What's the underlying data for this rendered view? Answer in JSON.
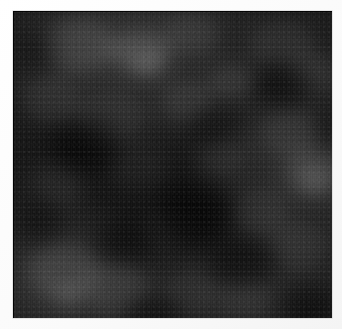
{
  "page": {
    "width": 342,
    "height": 329,
    "background_color": "#fdfdfd"
  },
  "panel": {
    "name": "dark mottled texture",
    "left": 13,
    "top": 11,
    "width": 319,
    "height": 307,
    "base_color": "#1b1b1b",
    "darkest_color": "#0d0d0d",
    "brightest_color": "#3a3a3a",
    "border_color": "#000000",
    "texture_kind": "cloudy-mottled-grain",
    "artifacts": "jpeg 8x8 block edges and fine vertical streaking",
    "has_text": false,
    "has_axes": false,
    "has_legend": false
  },
  "clouds": [
    {
      "x": 30,
      "y": 8,
      "w": 74,
      "h": 54,
      "color": "#3a3a3a",
      "alpha": 0.5,
      "tone": "light"
    },
    {
      "x": 96,
      "y": 18,
      "w": 62,
      "h": 44,
      "color": "#3d3d3d",
      "alpha": 0.55,
      "tone": "light"
    },
    {
      "x": 150,
      "y": 4,
      "w": 56,
      "h": 40,
      "color": "#333333",
      "alpha": 0.4,
      "tone": "light"
    },
    {
      "x": 236,
      "y": 10,
      "w": 66,
      "h": 46,
      "color": "#303030",
      "alpha": 0.38,
      "tone": "light"
    },
    {
      "x": 276,
      "y": 44,
      "w": 48,
      "h": 38,
      "color": "#363636",
      "alpha": 0.42,
      "tone": "light"
    },
    {
      "x": 10,
      "y": 66,
      "w": 58,
      "h": 48,
      "color": "#313131",
      "alpha": 0.36,
      "tone": "light"
    },
    {
      "x": 62,
      "y": 80,
      "w": 70,
      "h": 52,
      "color": "#2e2e2e",
      "alpha": 0.34,
      "tone": "light"
    },
    {
      "x": 148,
      "y": 70,
      "w": 54,
      "h": 40,
      "color": "#343434",
      "alpha": 0.38,
      "tone": "light"
    },
    {
      "x": 196,
      "y": 54,
      "w": 46,
      "h": 34,
      "color": "#383838",
      "alpha": 0.4,
      "tone": "light"
    },
    {
      "x": 246,
      "y": 96,
      "w": 62,
      "h": 52,
      "color": "#313131",
      "alpha": 0.36,
      "tone": "light"
    },
    {
      "x": 272,
      "y": 138,
      "w": 56,
      "h": 48,
      "color": "#373737",
      "alpha": 0.44,
      "tone": "light"
    },
    {
      "x": 184,
      "y": 128,
      "w": 50,
      "h": 40,
      "color": "#2d2d2d",
      "alpha": 0.3,
      "tone": "light"
    },
    {
      "x": 96,
      "y": 134,
      "w": 58,
      "h": 44,
      "color": "#2c2c2c",
      "alpha": 0.28,
      "tone": "light"
    },
    {
      "x": 18,
      "y": 150,
      "w": 54,
      "h": 46,
      "color": "#2f2f2f",
      "alpha": 0.32,
      "tone": "light"
    },
    {
      "x": 216,
      "y": 178,
      "w": 60,
      "h": 46,
      "color": "#2e2e2e",
      "alpha": 0.3,
      "tone": "light"
    },
    {
      "x": 132,
      "y": 196,
      "w": 48,
      "h": 38,
      "color": "#2a2a2a",
      "alpha": 0.26,
      "tone": "light"
    },
    {
      "x": 258,
      "y": 212,
      "w": 58,
      "h": 48,
      "color": "#303030",
      "alpha": 0.32,
      "tone": "light"
    },
    {
      "x": 14,
      "y": 232,
      "w": 72,
      "h": 56,
      "color": "#3a3a3a",
      "alpha": 0.48,
      "tone": "light"
    },
    {
      "x": 70,
      "y": 252,
      "w": 66,
      "h": 50,
      "color": "#363636",
      "alpha": 0.44,
      "tone": "light"
    },
    {
      "x": 150,
      "y": 258,
      "w": 56,
      "h": 44,
      "color": "#2c2c2c",
      "alpha": 0.3,
      "tone": "light"
    },
    {
      "x": 206,
      "y": 264,
      "w": 52,
      "h": 40,
      "color": "#303030",
      "alpha": 0.32,
      "tone": "light"
    },
    {
      "x": 118,
      "y": 40,
      "w": 34,
      "h": 26,
      "color": "#454545",
      "alpha": 0.45,
      "tone": "light"
    },
    {
      "x": 286,
      "y": 156,
      "w": 32,
      "h": 26,
      "color": "#424242",
      "alpha": 0.42,
      "tone": "light"
    },
    {
      "x": 40,
      "y": 272,
      "w": 34,
      "h": 26,
      "color": "#424242",
      "alpha": 0.4,
      "tone": "light"
    },
    {
      "x": 146,
      "y": 176,
      "w": 76,
      "h": 60,
      "color": "#050505",
      "alpha": 0.62,
      "tone": "dark"
    },
    {
      "x": 40,
      "y": 110,
      "w": 64,
      "h": 52,
      "color": "#070707",
      "alpha": 0.52,
      "tone": "dark"
    },
    {
      "x": 196,
      "y": 226,
      "w": 66,
      "h": 52,
      "color": "#060606",
      "alpha": 0.5,
      "tone": "dark"
    },
    {
      "x": 244,
      "y": 52,
      "w": 56,
      "h": 44,
      "color": "#080808",
      "alpha": 0.44,
      "tone": "dark"
    },
    {
      "x": 86,
      "y": 208,
      "w": 54,
      "h": 42,
      "color": "#070707",
      "alpha": 0.46,
      "tone": "dark"
    },
    {
      "x": 0,
      "y": 188,
      "w": 50,
      "h": 44,
      "color": "#080808",
      "alpha": 0.42,
      "tone": "dark"
    },
    {
      "x": 176,
      "y": 96,
      "w": 48,
      "h": 38,
      "color": "#090909",
      "alpha": 0.38,
      "tone": "dark"
    },
    {
      "x": 268,
      "y": 276,
      "w": 56,
      "h": 42,
      "color": "#050505",
      "alpha": 0.52,
      "tone": "dark"
    },
    {
      "x": 110,
      "y": 286,
      "w": 60,
      "h": 38,
      "color": "#060606",
      "alpha": 0.46,
      "tone": "dark"
    },
    {
      "x": 0,
      "y": 20,
      "w": 46,
      "h": 40,
      "color": "#0a0a0a",
      "alpha": 0.36,
      "tone": "dark"
    },
    {
      "x": 300,
      "y": 96,
      "w": 40,
      "h": 40,
      "color": "#090909",
      "alpha": 0.36,
      "tone": "dark"
    }
  ]
}
